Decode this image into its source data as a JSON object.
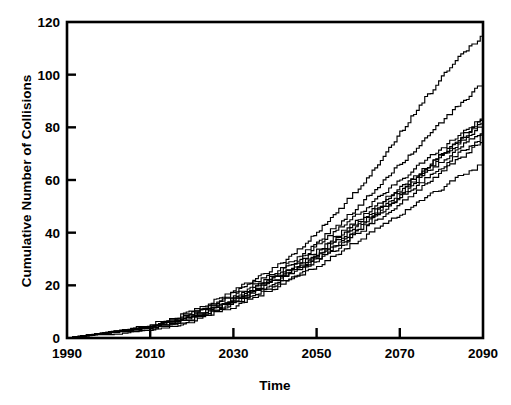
{
  "chart_data": {
    "type": "line",
    "title": "",
    "xlabel": "Time",
    "ylabel": "Cumulative Number of Collisions",
    "xlim": [
      1990,
      2090
    ],
    "ylim": [
      0,
      120
    ],
    "xticks": [
      1990,
      2010,
      2030,
      2050,
      2070,
      2090
    ],
    "yticks": [
      0,
      20,
      40,
      60,
      80,
      100,
      120
    ],
    "xtick_labels": [
      "1990",
      "2010",
      "2030",
      "2050",
      "2070",
      "2090"
    ],
    "ytick_labels": [
      "0",
      "20",
      "40",
      "60",
      "80",
      "100",
      "120"
    ],
    "grid": false,
    "legend": null,
    "legend_position": "none",
    "line_style": "step",
    "line_color": "#000000",
    "n_series": 10,
    "x": [
      1990,
      1995,
      2000,
      2005,
      2010,
      2015,
      2020,
      2025,
      2030,
      2035,
      2040,
      2045,
      2050,
      2055,
      2060,
      2065,
      2070,
      2075,
      2080,
      2085,
      2090
    ],
    "series": [
      {
        "name": "run-1",
        "values": [
          0,
          1,
          2,
          3,
          4,
          7,
          10,
          14,
          18,
          22,
          27,
          33,
          40,
          48,
          57,
          67,
          78,
          89,
          99,
          108,
          115
        ]
      },
      {
        "name": "run-2",
        "values": [
          0,
          1,
          2,
          3,
          5,
          7,
          10,
          13,
          17,
          21,
          25,
          30,
          36,
          43,
          50,
          58,
          66,
          74,
          82,
          90,
          97
        ]
      },
      {
        "name": "run-3",
        "values": [
          0,
          1,
          2,
          3,
          4,
          6,
          9,
          12,
          16,
          20,
          24,
          29,
          35,
          41,
          47,
          54,
          60,
          66,
          72,
          78,
          84
        ]
      },
      {
        "name": "run-4",
        "values": [
          0,
          1,
          2,
          3,
          4,
          6,
          9,
          12,
          15,
          19,
          23,
          28,
          33,
          39,
          45,
          51,
          57,
          63,
          70,
          77,
          83
        ]
      },
      {
        "name": "run-5",
        "values": [
          0,
          1,
          2,
          3,
          4,
          6,
          8,
          11,
          15,
          19,
          23,
          27,
          32,
          38,
          44,
          50,
          56,
          63,
          70,
          76,
          82
        ]
      },
      {
        "name": "run-6",
        "values": [
          0,
          1,
          2,
          3,
          4,
          6,
          8,
          11,
          14,
          18,
          22,
          26,
          31,
          37,
          43,
          49,
          55,
          62,
          69,
          75,
          81
        ]
      },
      {
        "name": "run-7",
        "values": [
          0,
          1,
          2,
          3,
          4,
          5,
          8,
          11,
          14,
          18,
          22,
          26,
          31,
          36,
          42,
          48,
          54,
          61,
          67,
          73,
          79
        ]
      },
      {
        "name": "run-8",
        "values": [
          0,
          1,
          2,
          3,
          4,
          5,
          7,
          10,
          13,
          17,
          21,
          25,
          30,
          35,
          41,
          47,
          53,
          59,
          65,
          71,
          77
        ]
      },
      {
        "name": "run-9",
        "values": [
          0,
          1,
          2,
          2,
          3,
          5,
          7,
          10,
          13,
          16,
          20,
          24,
          29,
          34,
          40,
          45,
          51,
          57,
          63,
          69,
          75
        ]
      },
      {
        "name": "run-10",
        "values": [
          0,
          1,
          1,
          2,
          3,
          4,
          6,
          9,
          12,
          15,
          19,
          23,
          27,
          32,
          37,
          42,
          47,
          52,
          57,
          62,
          66
        ]
      }
    ]
  }
}
